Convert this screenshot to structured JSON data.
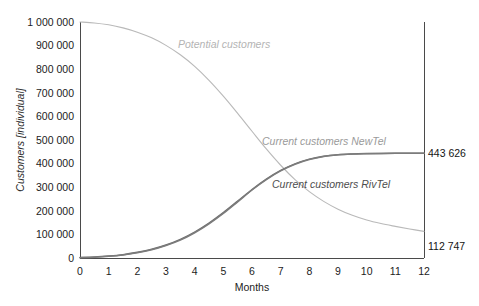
{
  "chart_data": {
    "type": "line",
    "title": "",
    "xlabel": "Months",
    "ylabel": "Customers [individual]",
    "xlim": [
      0,
      12
    ],
    "ylim": [
      0,
      1000000
    ],
    "grid": false,
    "legend_position": "inline-annotations",
    "x_ticks": [
      "0",
      "1",
      "2",
      "3",
      "4",
      "5",
      "6",
      "7",
      "8",
      "9",
      "10",
      "11",
      "12"
    ],
    "y_ticks": [
      "0",
      "100 000",
      "200 000",
      "300 000",
      "400 000",
      "500 000",
      "600 000",
      "700 000",
      "800 000",
      "900 000",
      "1 000 000"
    ],
    "x": [
      0,
      0.5,
      1,
      1.5,
      2,
      2.5,
      3,
      3.5,
      4,
      4.5,
      5,
      5.5,
      6,
      6.5,
      7,
      7.5,
      8,
      8.5,
      9,
      9.5,
      10,
      10.5,
      11,
      11.5,
      12
    ],
    "series": [
      {
        "name": "Potential customers",
        "color": "#b9b9b9",
        "label_color": "#b4b4b4",
        "end_value": 112747,
        "end_value_text": "112 747",
        "values": [
          1000000,
          996000,
          988000,
          975000,
          957000,
          933000,
          901000,
          861000,
          812000,
          753000,
          686000,
          613000,
          537000,
          462000,
          393000,
          332000,
          281000,
          240000,
          207000,
          181000,
          161000,
          146000,
          134000,
          123000,
          112747
        ]
      },
      {
        "name": "Current customers NewTel",
        "color": "#6e6e6e",
        "label_color": "#9a9a9a",
        "end_value": 443626,
        "end_value_text": "443 626",
        "values": [
          2000,
          4000,
          8000,
          14000,
          24000,
          37000,
          55000,
          79000,
          110000,
          148000,
          192000,
          241000,
          290000,
          334000,
          371000,
          399000,
          419000,
          431000,
          438000,
          441000,
          442500,
          443200,
          443450,
          443560,
          443626
        ]
      },
      {
        "name": "Current customers RivTel",
        "color": "#7c7c7c",
        "label_color": "#4d4d4d",
        "end_value": 443626,
        "end_value_text": "443 626",
        "values": [
          1500,
          3500,
          7000,
          13000,
          22000,
          35000,
          53000,
          76000,
          107000,
          145000,
          189000,
          238000,
          288000,
          332000,
          369000,
          397000,
          417000,
          430000,
          437000,
          440500,
          442000,
          443000,
          443350,
          443520,
          443626
        ]
      }
    ],
    "annotations": [
      {
        "text": "Potential customers",
        "x_px": 178,
        "y_px": 48,
        "color": "#b4b4b4"
      },
      {
        "text": "Current customers NewTel",
        "x_px": 262,
        "y_px": 145,
        "color": "#9a9a9a"
      },
      {
        "text": "Current customers RivTel",
        "x_px": 272,
        "y_px": 188,
        "color": "#4d4d4d"
      }
    ]
  }
}
